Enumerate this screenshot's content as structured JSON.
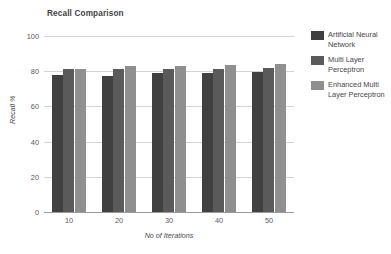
{
  "chart_data": {
    "type": "bar",
    "title": "Recall Comparison",
    "xlabel": "No of Iterations",
    "ylabel": "Recall %",
    "categories": [
      "10",
      "20",
      "30",
      "40",
      "50"
    ],
    "ylim": [
      0,
      100
    ],
    "yticks": [
      "0",
      "20",
      "40",
      "60",
      "80",
      "100"
    ],
    "grid": true,
    "legend_position": "right",
    "series": [
      {
        "name": "Artificial Neural Network",
        "color": "#404040",
        "values": [
          78,
          77.5,
          79,
          79,
          79.5
        ]
      },
      {
        "name": "Multi Layer Perceptron",
        "color": "#5a5a5a",
        "values": [
          81,
          81,
          81.5,
          81.5,
          82
        ]
      },
      {
        "name": "Enhanced Multi Layer Perceptron",
        "color": "#8f8f8f",
        "values": [
          81.5,
          83,
          83,
          83.5,
          84
        ]
      }
    ]
  }
}
